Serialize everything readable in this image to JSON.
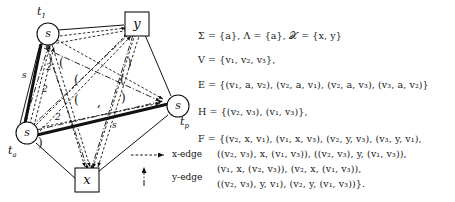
{
  "diagram": {
    "nodes": [
      {
        "id": "t1",
        "shape": "circle",
        "glyph": "s",
        "label": "t",
        "label_sub": "1",
        "cx": 48,
        "cy": 34
      },
      {
        "id": "y",
        "shape": "square",
        "glyph": "y",
        "label": "",
        "label_sub": "",
        "cx": 137,
        "cy": 24
      },
      {
        "id": "tp",
        "shape": "circle",
        "glyph": "s",
        "label": "t",
        "label_sub": "p",
        "cx": 178,
        "cy": 106
      },
      {
        "id": "ta",
        "shape": "circle",
        "glyph": "s",
        "label": "t",
        "label_sub": "a",
        "cx": 27,
        "cy": 133
      },
      {
        "id": "x",
        "shape": "square",
        "glyph": "x",
        "label": "",
        "label_sub": "",
        "cx": 87,
        "cy": 180
      }
    ],
    "edge_labels": [
      {
        "text": "s",
        "x": 22,
        "y": 70
      },
      {
        "text": "2",
        "x": 46,
        "y": 62
      },
      {
        "text": "2",
        "x": 42,
        "y": 84
      },
      {
        "text": "2",
        "x": 55,
        "y": 112
      },
      {
        "text": "s",
        "x": 112,
        "y": 120
      }
    ],
    "paren_labels": [
      {
        "text": "(",
        "x": 59,
        "y": 58
      },
      {
        "text": ")",
        "x": 127,
        "y": 58
      },
      {
        "text": "(",
        "x": 74,
        "y": 75
      },
      {
        "text": "(",
        "x": 120,
        "y": 75
      },
      {
        "text": "(",
        "x": 74,
        "y": 95
      },
      {
        "text": ")",
        "x": 121,
        "y": 93
      },
      {
        "text": ",",
        "x": 97,
        "y": 97
      },
      {
        "text": ")",
        "x": 38,
        "y": 138
      }
    ]
  },
  "legend": {
    "x_edge_label": "x-edge",
    "y_edge_label": "y-edge",
    "x_edge_style": "dashed-arrow-right",
    "y_edge_style": "dashdot-arrow-up"
  },
  "math": {
    "line1": "Σ = {a}, Λ = {a}, 𝒳 = {x, y}",
    "line2": "V = {v₁, v₂, v₃},",
    "line3": "E = {(v₁, a, v₂), (v₂, a, v₁), (v₂, a, v₃), (v₃, a, v₂)}",
    "line4": "H = {(v₂, v₃), (v₁, v₃)},",
    "line5": "F = {(v₂, x, v₁), (v₁, x, v₃), (v₂, y, v₃), (v₃, y, v₁),",
    "line6": "((v₂, v₃), x, (v₁, v₃)), ((v₂, v₃), y, (v₁, v₃)),",
    "line7": "(v₁, x, (v₂, v₃)), (v₂, x, (v₁, v₃)),",
    "line8": "((v₂, v₃), y, v₁), (v₂, y, (v₁, v₃))}."
  },
  "colors": {
    "ink": "#111111",
    "background": "#ffffff"
  }
}
